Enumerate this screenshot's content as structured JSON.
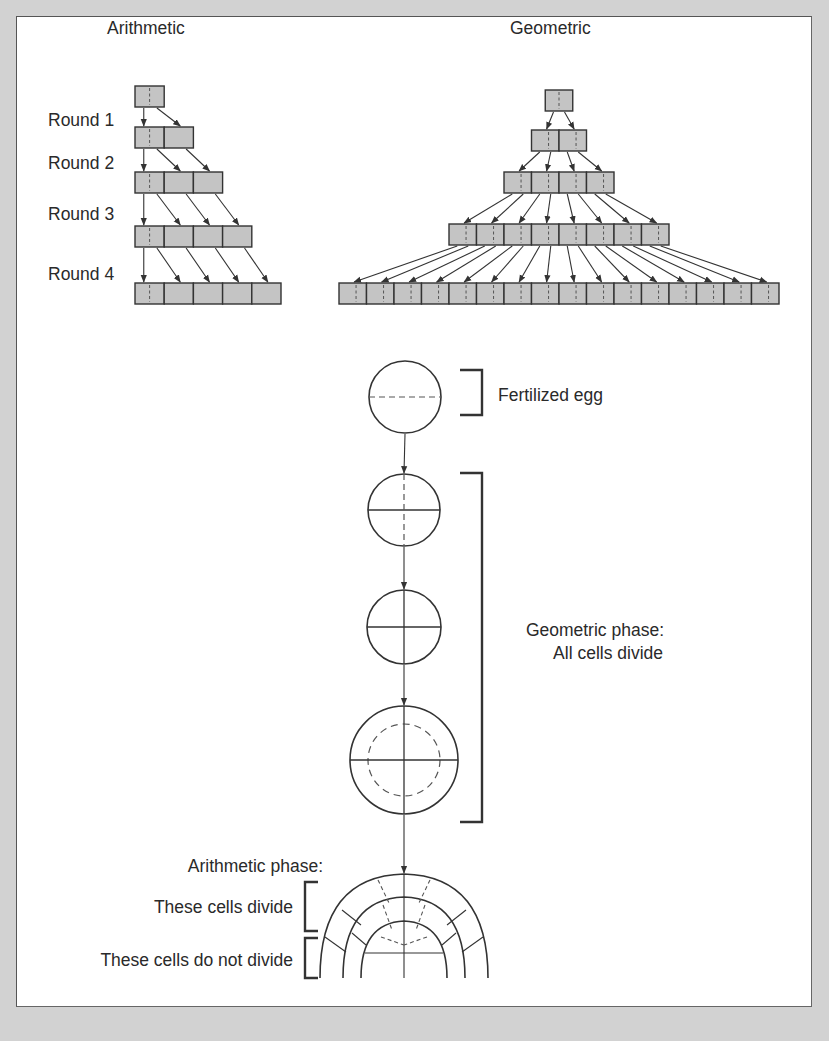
{
  "colors": {
    "background": "#d2d2d2",
    "panel": "#ffffff",
    "cell_fill": "#c4c4c4",
    "stroke": "#333333",
    "text": "#2a2a2a"
  },
  "titles": {
    "arithmetic": "Arithmetic",
    "geometric": "Geometric"
  },
  "rounds": [
    "Round 1",
    "Round 2",
    "Round 3",
    "Round 4"
  ],
  "labels": {
    "fertilized_egg": "Fertilized egg",
    "geometric_phase_line1": "Geometric phase:",
    "geometric_phase_line2": "All cells divide",
    "arithmetic_phase": "Arithmetic phase:",
    "these_cells_divide": "These cells divide",
    "these_cells_do_not_divide": "These cells do not divide"
  },
  "arithmetic_growth": {
    "cell_counts": [
      1,
      2,
      3,
      4,
      5
    ],
    "x0": 135,
    "cell_w": 29.2,
    "cell_h": 21,
    "row_y": [
      86,
      127,
      172,
      226,
      283
    ]
  },
  "geometric_growth": {
    "cell_counts": [
      1,
      2,
      4,
      8,
      16
    ],
    "center_x": 559,
    "cell_w": 27.5,
    "cell_h": 21,
    "row_y": [
      90,
      130,
      172,
      224,
      283
    ]
  },
  "embryo_stages": [
    {
      "stage": "fertilized egg",
      "cx": 405,
      "cy": 397,
      "r": 36,
      "division": "horizontal dashed"
    },
    {
      "stage": "2-cell",
      "cx": 404,
      "cy": 510,
      "r": 36,
      "division": "horizontal solid, vertical dashed"
    },
    {
      "stage": "4-cell",
      "cx": 404,
      "cy": 627,
      "r": 37,
      "division": "cross solid"
    },
    {
      "stage": "multi-cell",
      "cx": 404,
      "cy": 760,
      "r": 54,
      "inner_r": 36,
      "division": "cross solid, inner dashed circle"
    }
  ]
}
